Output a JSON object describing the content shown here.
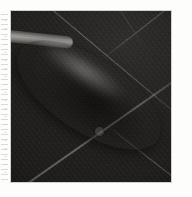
{
  "page": {
    "background_color": "#fdfdfc",
    "margin_artifact": {
      "name": "dashed-scan-margin",
      "color": "#a8a8aa",
      "edge": "left"
    }
  },
  "photo": {
    "caption": "",
    "alt_text": "Pale grey ellipsoidal object with a slender handle resting on a dark tiled surface",
    "frame": {
      "left_px": 11,
      "top_px": 11,
      "width_px": 160,
      "height_px": 171,
      "border_color": "#787878"
    },
    "background": {
      "name": "dark-tiled-surface",
      "base_color": "#232120",
      "highlight_color": "#2e2c2b",
      "shadow_color": "#1a1918",
      "grout_color": "#b2b2ae",
      "grout_lines": [
        {
          "name": "grout-line-upper-diagonal",
          "angle_deg": 40
        },
        {
          "name": "grout-line-lower-diagonal",
          "angle_deg": -35
        },
        {
          "name": "grout-line-upper-right",
          "angle_deg": -38
        },
        {
          "name": "grout-line-bottom-right",
          "angle_deg": 38
        },
        {
          "name": "grout-line-faint-upper",
          "angle_deg": 58
        }
      ]
    },
    "object": {
      "name": "ellipsoid-object",
      "orientation_deg": 33,
      "body_color": "#adaba6",
      "highlight_color": "#d7d6d1",
      "shadow_color": "#63615e",
      "rim_color": "#464442",
      "handle": {
        "name": "object-handle",
        "color": "#a9a7a2",
        "angle_deg": 6
      },
      "mark": {
        "name": "vent-hole-mark",
        "shape": "circle",
        "color": "#3a3836",
        "center_x_px": 95,
        "center_y_px": 130,
        "diameter_px": 8
      }
    }
  }
}
